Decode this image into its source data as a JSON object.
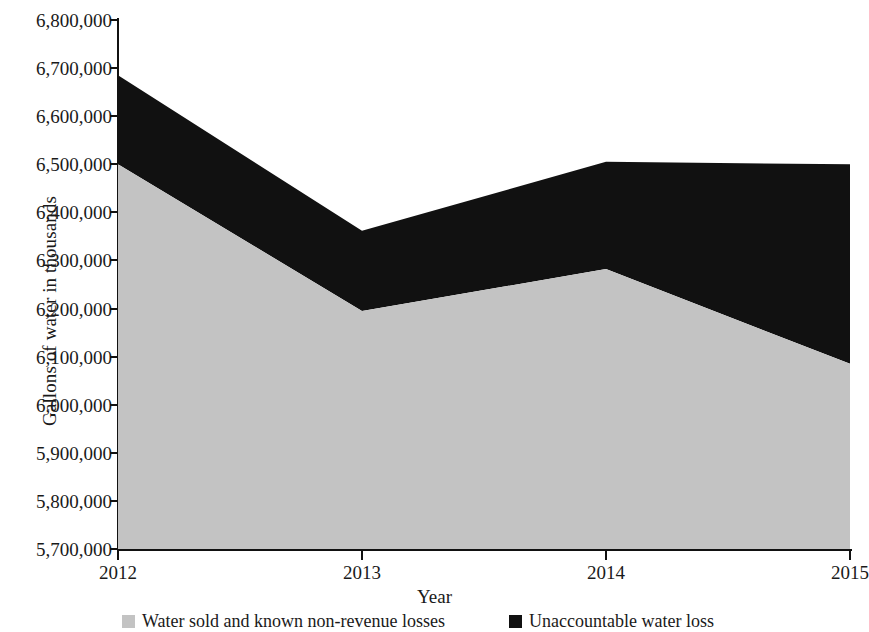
{
  "chart_data": {
    "type": "area",
    "stacked": true,
    "title": "",
    "xlabel": "Year",
    "ylabel": "Gallons of water in thousands",
    "categories": [
      "2012",
      "2013",
      "2014",
      "2015"
    ],
    "x": [
      2012,
      2013,
      2014,
      2015
    ],
    "ylim": [
      5700000,
      6800000
    ],
    "ytick_step": 100000,
    "ytick_labels": [
      "6,800,000",
      "6,700,000",
      "6,600,000",
      "6,500,000",
      "6,400,000",
      "6,300,000",
      "6,200,000",
      "6,100,000",
      "6,000,000",
      "5,900,000",
      "5,800,000",
      "5,700,000"
    ],
    "ytick_values": [
      6800000,
      6700000,
      6600000,
      6500000,
      6400000,
      6300000,
      6200000,
      6100000,
      6000000,
      5900000,
      5800000,
      5700000
    ],
    "grid": false,
    "legend_position": "bottom",
    "series": [
      {
        "name": "Water sold and known non-revenue losses",
        "color": "#c3c3c3",
        "values": [
          6500000,
          6195000,
          6282000,
          6085000
        ]
      },
      {
        "name": "Unaccountable water loss",
        "color": "#111111",
        "values": [
          185000,
          167000,
          223000,
          415000
        ],
        "cumulative_top": [
          6685000,
          6362000,
          6505000,
          6500000
        ]
      }
    ]
  },
  "axes": {
    "y_title": "Gallons of water in thousands",
    "x_title": "Year"
  },
  "legend": {
    "items": [
      {
        "label": "Water sold and known non-revenue losses",
        "color": "#c3c3c3"
      },
      {
        "label": "Unaccountable water loss",
        "color": "#111111"
      }
    ]
  }
}
